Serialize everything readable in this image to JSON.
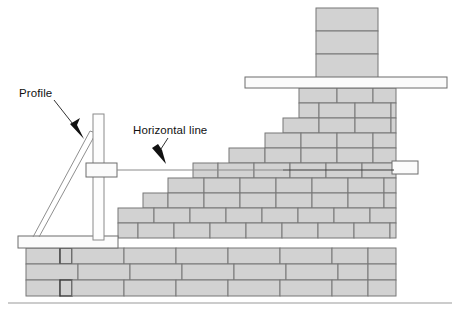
{
  "diagram": {
    "labels": {
      "profile": "Profile",
      "horizontal_line": "Horizontal line"
    },
    "colors": {
      "brick_fill": "#d2d2d2",
      "brick_stroke": "#777777",
      "brick_stroke_dark": "#3a3a3a",
      "board_fill": "#fbfbfb",
      "board_stroke": "#6d6d6d",
      "line": "#3d3d3d",
      "background": "#ffffff",
      "text": "#111111"
    },
    "parts": {
      "profile_post": "profile-post",
      "profile_brace": "profile-brace",
      "line_block_left": "line-block-left",
      "line_block_right": "line-block-right",
      "string_line": "string-line",
      "top_plank": "top-plank",
      "base_board": "base-board",
      "chimney": "chimney-column",
      "ground_line": "ground-line"
    },
    "counts": {
      "chimney_courses": "3",
      "stepped_courses": "5",
      "base_courses": "3"
    }
  }
}
